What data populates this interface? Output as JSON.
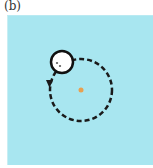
{
  "figure": {
    "label": "(b)",
    "background_color": "#a8e6f0",
    "orbit": {
      "style": "dashed",
      "direction": "counterclockwise",
      "color": "#1a1a1a"
    },
    "center_point": {
      "color": "#e8a050"
    },
    "ball": {
      "fill": "#ffffff",
      "stroke": "#111111"
    }
  }
}
